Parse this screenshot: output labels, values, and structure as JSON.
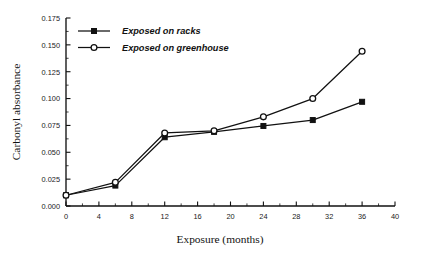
{
  "chart_data": {
    "type": "line",
    "title": "",
    "xlabel": "Exposure (months)",
    "ylabel": "Carbonyl absorbance",
    "xlim": [
      0,
      40
    ],
    "ylim": [
      0.0,
      0.175
    ],
    "grid": false,
    "legend_position": "top-left",
    "x_ticks": [
      0,
      4,
      8,
      12,
      16,
      20,
      24,
      28,
      32,
      36,
      40
    ],
    "x_tick_labels": [
      "0",
      "4",
      "8",
      "12",
      "16",
      "20",
      "24",
      "28",
      "32",
      "36",
      "40"
    ],
    "y_ticks": [
      0.0,
      0.025,
      0.05,
      0.075,
      0.1,
      0.125,
      0.15,
      0.175
    ],
    "y_tick_labels": [
      "0.000",
      "0.025",
      "0.050",
      "0.075",
      "0.100",
      "0.125",
      "0.150",
      "0.175"
    ],
    "x": [
      0,
      6,
      12,
      18,
      24,
      30,
      36
    ],
    "series": [
      {
        "name": "Exposed on racks",
        "marker": "filled-square",
        "values": [
          0.01,
          0.019,
          0.064,
          0.069,
          0.0745,
          0.08,
          0.097
        ]
      },
      {
        "name": "Exposed on greenhouse",
        "marker": "open-circle",
        "values": [
          0.01,
          0.022,
          0.068,
          0.07,
          0.083,
          0.1,
          0.144
        ]
      }
    ]
  },
  "legend": {
    "entries": [
      {
        "label": "Exposed on racks"
      },
      {
        "label": "Exposed on greenhouse"
      }
    ]
  },
  "axes": {
    "x_title": "Exposure (months)",
    "y_title": "Carbonyl absorbance"
  },
  "colors": {
    "ink": "#111111",
    "background": "#ffffff"
  }
}
